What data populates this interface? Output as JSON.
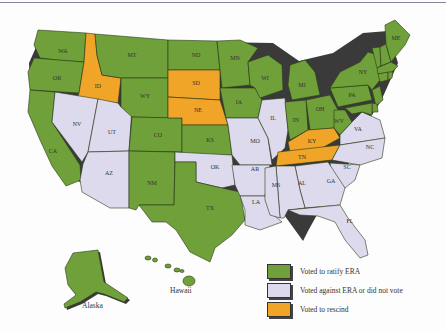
{
  "colors": {
    "ratified": "#6fa03a",
    "against": "#dcdaec",
    "rescinded": "#f0a428",
    "shadow": "#3a3a3a"
  },
  "legend": [
    {
      "key": "ratified",
      "label": "Voted to ratify ERA"
    },
    {
      "key": "against",
      "label": "Voted against ERA or did not vote"
    },
    {
      "key": "rescinded",
      "label": "Voted to rescind"
    }
  ],
  "insets": {
    "alaska": "Alaska",
    "hawaii": "Hawaii"
  },
  "states": {
    "ratified": [
      "WA",
      "OR",
      "CA",
      "MT",
      "WY",
      "CO",
      "NM",
      "TX",
      "ND",
      "MN",
      "IA",
      "KS",
      "WI",
      "MI",
      "IN",
      "OH",
      "WV",
      "PA",
      "NY",
      "ME",
      "NH",
      "VT",
      "MA",
      "RI",
      "CT",
      "NJ",
      "DE",
      "MD",
      "AK",
      "HI"
    ],
    "against": [
      "NV",
      "UT",
      "AZ",
      "OK",
      "MO",
      "IL",
      "AR",
      "LA",
      "MS",
      "AL",
      "GA",
      "SC",
      "NC",
      "VA",
      "FL"
    ],
    "rescinded": [
      "ID",
      "SD",
      "NE",
      "KY",
      "TN"
    ]
  },
  "labels": {
    "WA": "WA",
    "OR": "OR",
    "CA": "CA",
    "ID": "ID",
    "NV": "NV",
    "UT": "UT",
    "AZ": "AZ",
    "MT": "MT",
    "WY": "WY",
    "CO": "CO",
    "NM": "NM",
    "ND": "ND",
    "SD": "SD",
    "NE": "NE",
    "KS": "KS",
    "OK": "OK",
    "TX": "TX",
    "MN": "MN",
    "IA": "IA",
    "MO": "MO",
    "AR": "AR",
    "LA": "LA",
    "WI": "WI",
    "IL": "IL",
    "MI": "MI",
    "IN": "IN",
    "OH": "OH",
    "KY": "KY",
    "TN": "TN",
    "MS": "MS",
    "AL": "AL",
    "GA": "GA",
    "FL": "FL",
    "SC": "SC",
    "NC": "NC",
    "VA": "VA",
    "WV": "WV",
    "PA": "PA",
    "NY": "NY",
    "ME": "ME"
  }
}
